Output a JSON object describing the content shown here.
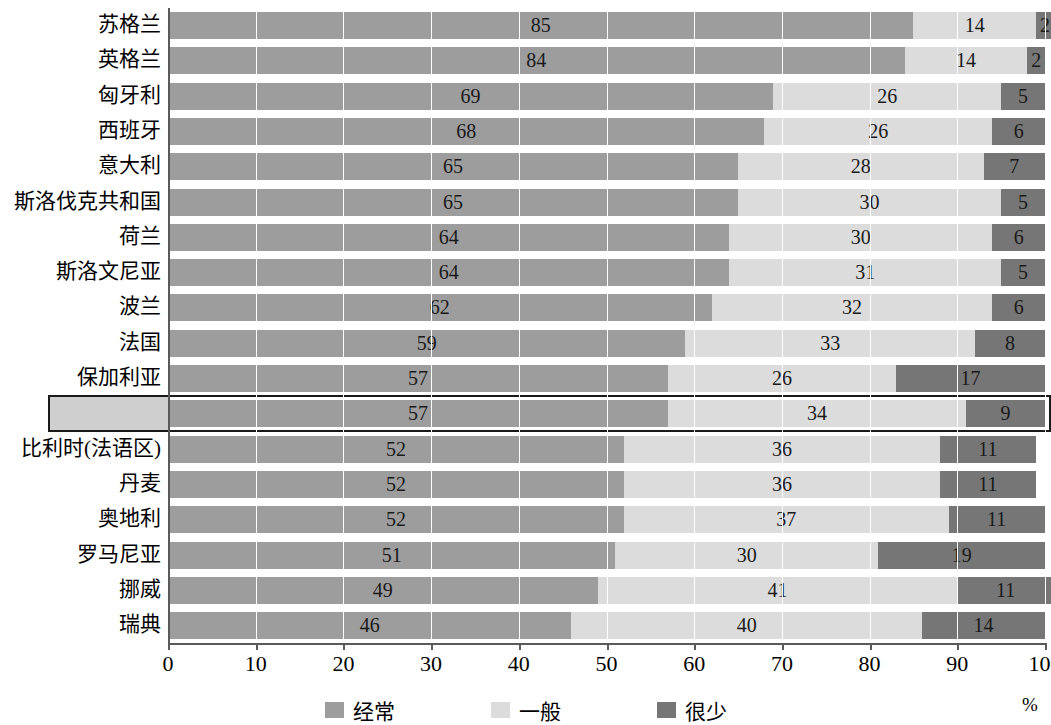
{
  "chart_data": {
    "type": "bar",
    "subtype": "horizontal-100-percent-stacked",
    "title": "",
    "xlabel": "%",
    "ylabel": "",
    "xlim": [
      0,
      100
    ],
    "xticks": [
      "0",
      "10",
      "20",
      "30",
      "40",
      "50",
      "60",
      "70",
      "80",
      "90",
      "100"
    ],
    "grid": true,
    "legend_position": "bottom",
    "categories": [
      "苏格兰",
      "英格兰",
      "匈牙利",
      "西班牙",
      "意大利",
      "斯洛伐克共和国",
      "荷兰",
      "斯洛文尼亚",
      "波兰",
      "法国",
      "保加利亚",
      "德国",
      "比利时(法语区)",
      "丹麦",
      "奥地利",
      "罗马尼亚",
      "挪威",
      "瑞典"
    ],
    "series": [
      {
        "name": "经常",
        "color": "#9d9d9d",
        "values": [
          85,
          84,
          69,
          68,
          65,
          65,
          64,
          64,
          62,
          59,
          57,
          57,
          52,
          52,
          52,
          51,
          49,
          46
        ]
      },
      {
        "name": "一般",
        "color": "#dcdcdc",
        "values": [
          14,
          14,
          26,
          26,
          28,
          30,
          30,
          31,
          32,
          33,
          26,
          34,
          36,
          36,
          37,
          30,
          41,
          40
        ]
      },
      {
        "name": "很少",
        "color": "#767676",
        "values": [
          2,
          2,
          5,
          6,
          7,
          5,
          6,
          5,
          6,
          8,
          17,
          9,
          11,
          11,
          11,
          19,
          11,
          14
        ]
      }
    ],
    "highlighted_category": "德国"
  },
  "legend": {
    "items": [
      {
        "label": "经常",
        "color": "#9d9d9d",
        "swatch": "legend-swatch-frequent"
      },
      {
        "label": "一般",
        "color": "#dcdcdc",
        "swatch": "legend-swatch-sometimes"
      },
      {
        "label": "很少",
        "color": "#767676",
        "swatch": "legend-swatch-rarely"
      }
    ]
  },
  "axis": {
    "unit_label": "%"
  }
}
